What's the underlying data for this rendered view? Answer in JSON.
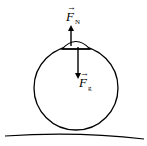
{
  "diagram": {
    "type": "free-body diagram",
    "objects": {
      "ball": {
        "shape": "circle",
        "cx": 76,
        "cy": 88,
        "r": 42
      },
      "cap": {
        "shape": "dome",
        "description": "small object resting on top of ball"
      },
      "ground": {
        "shape": "curved line"
      }
    },
    "forces": [
      {
        "id": "normal",
        "symbol": "F",
        "vector_mark": "→",
        "subscript": "N",
        "direction": "up"
      },
      {
        "id": "gravity",
        "symbol": "F",
        "vector_mark": "→",
        "subscript": "g",
        "direction": "down"
      }
    ],
    "colors": {
      "stroke": "#000000",
      "background": "#ffffff"
    }
  }
}
